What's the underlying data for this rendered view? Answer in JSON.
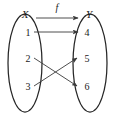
{
  "diagram": {
    "type": "function-mapping-diagram",
    "title": "",
    "colors": {
      "background": "#ffffff",
      "stroke": "#262626",
      "edge": "#3a3a3a",
      "text": "#1b1b1b"
    },
    "domain_set": {
      "name": "X",
      "label": "X",
      "elements": [
        {
          "label": "1",
          "x": 28,
          "y": 33
        },
        {
          "label": "2",
          "x": 28,
          "y": 60
        },
        {
          "label": "3",
          "x": 28,
          "y": 88
        }
      ],
      "oval": {
        "cx": 25,
        "cy": 63,
        "rx": 17,
        "ry": 49
      }
    },
    "codomain_set": {
      "name": "Y",
      "label": "Y",
      "elements": [
        {
          "label": "4",
          "x": 86,
          "y": 36
        },
        {
          "label": "5",
          "x": 86,
          "y": 63
        },
        {
          "label": "6",
          "x": 86,
          "y": 90
        }
      ],
      "oval": {
        "cx": 90,
        "cy": 63,
        "rx": 17,
        "ry": 49
      }
    },
    "mapping_arrow": {
      "label": "f",
      "from": "X",
      "to": "Y",
      "label_x": 57,
      "label_y": 11
    },
    "edges": [
      {
        "from": "1",
        "to": "4",
        "x1": 34,
        "y1": 32,
        "x2": 79,
        "y2": 32
      },
      {
        "from": "2",
        "to": "6",
        "x1": 34,
        "y1": 58,
        "x2": 79,
        "y2": 87
      },
      {
        "from": "3",
        "to": "5",
        "x1": 34,
        "y1": 86,
        "x2": 79,
        "y2": 58
      }
    ]
  }
}
